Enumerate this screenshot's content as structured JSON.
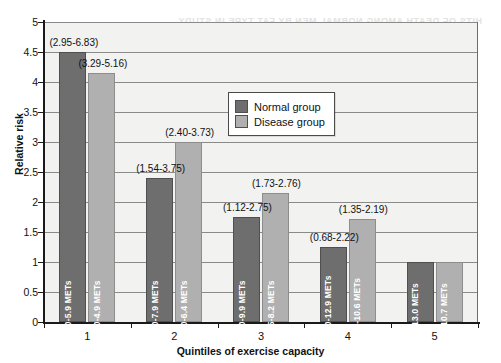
{
  "page": {
    "bleed_through_text": "HITS OF DEATH AMONG NORMAL MEN BY FAT TYPE IN STUDY"
  },
  "legend": {
    "position": "inside-top-center",
    "entries": [
      {
        "label": "Normal group",
        "color": "#6e6e6e",
        "swatch": "normal"
      },
      {
        "label": "Disease group",
        "color": "#b0b0b0",
        "swatch": "disease"
      }
    ]
  },
  "chart_data": {
    "type": "bar",
    "title": "",
    "xlabel": "Quintiles of exercise capacity",
    "ylabel": "Relative risk",
    "categories": [
      "1",
      "2",
      "3",
      "4",
      "5"
    ],
    "ylim": [
      0,
      5
    ],
    "yticks": [
      "0",
      "0.5",
      "1",
      "1.5",
      "2",
      "2.5",
      "3",
      "3.5",
      "4",
      "4.5",
      "5"
    ],
    "grid": true,
    "series": [
      {
        "name": "Normal group",
        "color": "#6e6e6e",
        "values": [
          4.5,
          2.4,
          1.75,
          1.25,
          1.0
        ],
        "ci_labels": [
          "(2.95-6.83)",
          "(1.54-3.75)",
          "(1.12-2.75)",
          "(0.68-2.22)",
          ""
        ],
        "bar_labels": [
          "1.0-5.9 METs",
          "6.0-7.9 METs",
          "8.0-9.9 METs",
          "10.0-12.9 METs",
          "≥13.0 METs"
        ]
      },
      {
        "name": "Disease group",
        "color": "#b0b0b0",
        "values": [
          4.15,
          3.0,
          2.15,
          1.72,
          1.0
        ],
        "ci_labels": [
          "(3.29-5.16)",
          "(2.40-3.73)",
          "(1.73-2.76)",
          "(1.35-2.19)",
          ""
        ],
        "bar_labels": [
          "1.0-4.9 METs",
          "5.0-6.4 METs",
          "6.5-8.2 METs",
          "8.3-10.6 METs",
          "≥10.7 METs"
        ]
      }
    ]
  }
}
